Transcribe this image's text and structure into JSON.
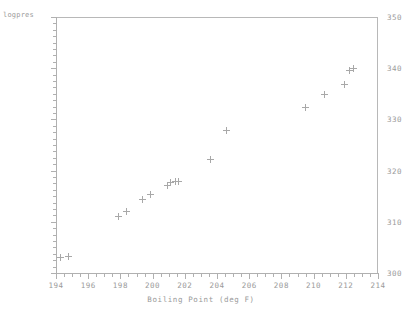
{
  "chart_data": {
    "type": "scatter",
    "title": "",
    "xlabel": "Boiling Point (deg F)",
    "ylabel": "logpres",
    "xlim": [
      194,
      214
    ],
    "ylim": [
      300,
      350
    ],
    "xticks": [
      194,
      196,
      198,
      200,
      202,
      204,
      206,
      208,
      210,
      212,
      214
    ],
    "yticks": [
      300,
      310,
      320,
      330,
      340,
      350
    ],
    "x_minor_step": 0.5,
    "y_minor_step": 1.25,
    "grid": false,
    "legend": null,
    "marker": "plus-marker",
    "marker_color": "#a8a8a8",
    "axis_color": "#b0b0b0",
    "text_color": "#9a9a9a",
    "background": "#ffffff",
    "points": [
      {
        "x": 194.3,
        "y": 303.1
      },
      {
        "x": 194.8,
        "y": 303.2
      },
      {
        "x": 197.9,
        "y": 311.0
      },
      {
        "x": 198.4,
        "y": 312.1
      },
      {
        "x": 199.4,
        "y": 314.4
      },
      {
        "x": 199.9,
        "y": 315.3
      },
      {
        "x": 200.9,
        "y": 317.0
      },
      {
        "x": 201.1,
        "y": 317.7
      },
      {
        "x": 201.4,
        "y": 317.8
      },
      {
        "x": 201.6,
        "y": 317.9
      },
      {
        "x": 203.6,
        "y": 322.2
      },
      {
        "x": 204.6,
        "y": 327.9
      },
      {
        "x": 209.5,
        "y": 332.4
      },
      {
        "x": 210.7,
        "y": 334.8
      },
      {
        "x": 211.9,
        "y": 336.9
      },
      {
        "x": 212.2,
        "y": 339.6
      },
      {
        "x": 212.5,
        "y": 340.0
      }
    ]
  }
}
